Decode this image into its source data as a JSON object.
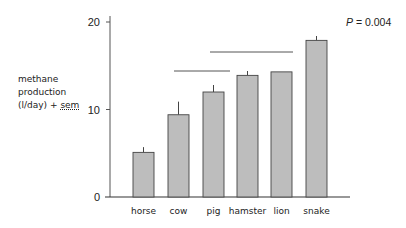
{
  "chart_data": {
    "type": "bar",
    "title": "",
    "xlabel": "",
    "ylabel": "methane production (l/day) + sem",
    "ylabel_lines": [
      "methane",
      "production",
      "(l/day) + ",
      "sem"
    ],
    "categories": [
      "horse",
      "cow",
      "pig",
      "hamster",
      "lion",
      "snake"
    ],
    "values": [
      5.1,
      9.4,
      12.0,
      13.9,
      14.3,
      17.9
    ],
    "errors": [
      0.6,
      1.5,
      0.8,
      0.5,
      0.0,
      0.5
    ],
    "ylim": [
      0,
      20
    ],
    "yticks": [
      0,
      10,
      20
    ],
    "grid": false,
    "legend": null,
    "annotations": [
      {
        "type": "text",
        "label": "P",
        "value": "= 0.004"
      },
      {
        "type": "bracket",
        "from": "cow",
        "to": "pig"
      },
      {
        "type": "bracket",
        "from": "pig",
        "to": "lion"
      }
    ],
    "bar_color": "#bdbdbd",
    "edge_color": "#444444"
  }
}
